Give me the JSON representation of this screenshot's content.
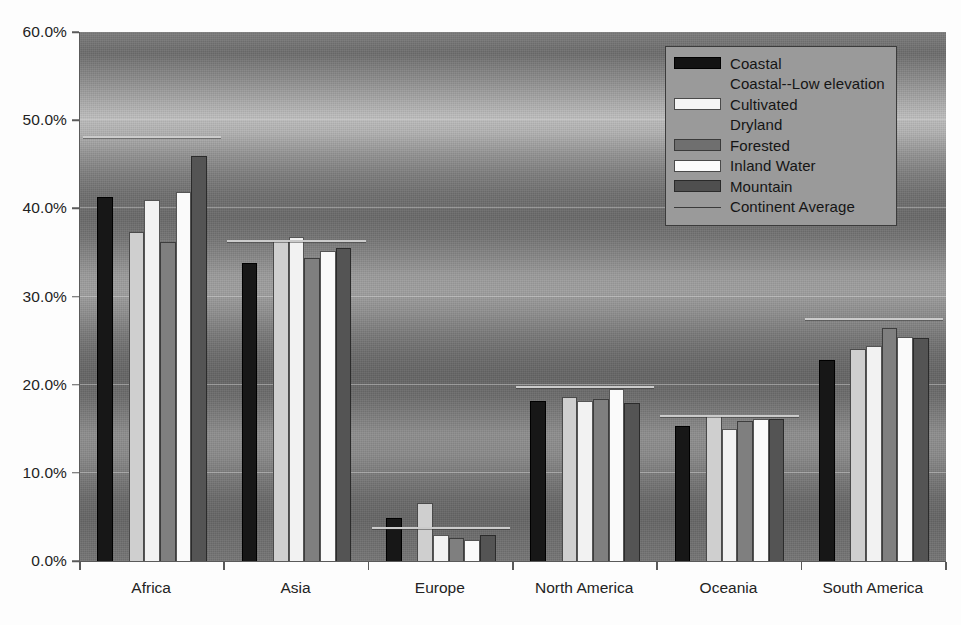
{
  "chart_data": {
    "type": "bar",
    "title": "",
    "subtitle": "",
    "xlabel": "",
    "ylabel": "",
    "ylim": [
      0,
      60
    ],
    "y_tick_format": "percent",
    "grid": true,
    "legend_position": "top-right",
    "categories": [
      "Africa",
      "Asia",
      "Europe",
      "North America",
      "Oceania",
      "South America"
    ],
    "y_ticks": [
      "0.0%",
      "10.0%",
      "20.0%",
      "30.0%",
      "40.0%",
      "50.0%",
      "60.0%"
    ],
    "y_tick_values": [
      0,
      10,
      20,
      30,
      40,
      50,
      60
    ],
    "series": [
      {
        "name": "Coastal",
        "color": "#171717",
        "values": [
          41.3,
          33.8,
          4.9,
          18.2,
          15.3,
          22.8
        ]
      },
      {
        "name": "Coastal--Low elevation",
        "color": "#8c8c8c",
        "values": [
          null,
          null,
          null,
          null,
          null,
          null
        ]
      },
      {
        "name": "Cultivated",
        "color": "#cfcfcf",
        "values": [
          37.3,
          36.3,
          6.6,
          18.6,
          16.5,
          24.1
        ]
      },
      {
        "name": "Dryland",
        "color": "#f2f2f2",
        "values": [
          41.0,
          36.7,
          3.0,
          18.1,
          15.0,
          24.4
        ]
      },
      {
        "name": "Forested",
        "color": "#7f7f7f",
        "values": [
          36.2,
          34.4,
          2.6,
          18.4,
          15.9,
          26.4
        ]
      },
      {
        "name": "Inland Water",
        "color": "#fafafa",
        "values": [
          41.8,
          35.2,
          2.4,
          19.5,
          16.1,
          25.4
        ]
      },
      {
        "name": "Mountain",
        "color": "#545454",
        "values": [
          45.9,
          35.5,
          2.9,
          17.9,
          16.1,
          25.3
        ]
      }
    ],
    "reference_line": {
      "name": "Continent Average",
      "color": "#cbcbcb",
      "values": [
        48.0,
        36.2,
        3.6,
        19.6,
        16.3,
        27.3
      ]
    },
    "legend_entries": [
      "Coastal",
      "Coastal--Low elevation",
      "Cultivated",
      "Dryland",
      "Forested",
      "Inland Water",
      "Mountain",
      "Continent Average"
    ]
  },
  "colors": {
    "plot_background_mid": "#7c7c7c",
    "legend_background": "#9a9a9a",
    "axis": "#5a5a5a",
    "text": "#232323",
    "gridline": "#e1e1e1"
  }
}
